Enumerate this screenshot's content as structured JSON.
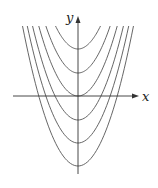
{
  "diagram": {
    "axes": {
      "x_label": "x",
      "y_label": "y",
      "origin_px": [
        78,
        96
      ],
      "x_axis_px": [
        13,
        139
      ],
      "y_axis_px": [
        174,
        17
      ]
    },
    "curve_color": "#555555",
    "axis_color": "#333333",
    "scale_a": 0.0455,
    "clip_top_px": 26,
    "vertex_y_px": [
      49,
      73,
      96,
      120,
      143,
      166
    ],
    "curves": [
      {
        "name": "C = 2",
        "vertex_y": 49
      },
      {
        "name": "C = 1",
        "vertex_y": 73
      },
      {
        "name": "C = 0",
        "vertex_y": 96
      },
      {
        "name": "C = -1",
        "vertex_y": 120
      },
      {
        "name": "C = -2",
        "vertex_y": 143
      },
      {
        "name": "C = -3",
        "vertex_y": 166
      }
    ]
  }
}
